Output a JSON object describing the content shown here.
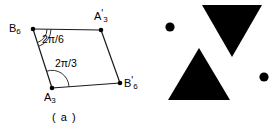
{
  "figure": {
    "panels": [
      {
        "id": "a",
        "caption": "( a )",
        "description": "parallelogram-with-angles",
        "vertices": [
          {
            "name": "B6",
            "base": "B",
            "sub": "6",
            "prime": "",
            "x": 33,
            "y": 29
          },
          {
            "name": "A3p",
            "base": "A",
            "sub": "3",
            "prime": "'",
            "x": 101,
            "y": 30
          },
          {
            "name": "A3",
            "base": "A",
            "sub": "3",
            "prime": "",
            "x": 52,
            "y": 88
          },
          {
            "name": "B6p",
            "base": "B",
            "sub": "6",
            "prime": "'",
            "x": 120,
            "y": 83
          }
        ],
        "edges": [
          {
            "from": "B6",
            "to": "A3p"
          },
          {
            "from": "A3p",
            "to": "B6p"
          },
          {
            "from": "A3",
            "to": "B6p"
          },
          {
            "from": "B6",
            "to": "A3"
          }
        ],
        "angles": [
          {
            "at": "B6",
            "label": "2π/6",
            "arcs": 2,
            "label_x": 42,
            "label_y": 34
          },
          {
            "at": "A3",
            "label": "2π/3",
            "arcs": 1,
            "label_x": 55,
            "label_y": 58
          }
        ]
      },
      {
        "id": "b",
        "caption": "( b )",
        "description": "two-filled-triangles-and-two-dots",
        "shapes": [
          {
            "kind": "triangle",
            "orientation": "down",
            "cx": 232,
            "cy": 31,
            "half_width": 30,
            "height": 52,
            "fill": "#000000"
          },
          {
            "kind": "triangle",
            "orientation": "up",
            "cx": 199,
            "cy": 74,
            "half_width": 31,
            "height": 53,
            "fill": "#000000"
          },
          {
            "kind": "dot",
            "cx": 170,
            "cy": 27,
            "r": 4.5,
            "fill": "#000000"
          },
          {
            "kind": "dot",
            "cx": 264,
            "cy": 77,
            "r": 4.5,
            "fill": "#000000"
          }
        ]
      }
    ],
    "colors": {
      "stroke": "#1a1a1a",
      "fill": "#000000",
      "background": "#ffffff"
    }
  }
}
